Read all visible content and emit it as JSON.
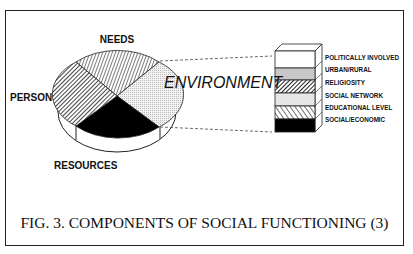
{
  "figure": {
    "caption": "FIG. 3. COMPONENTS OF SOCIAL FUNCTIONING (3)",
    "pie": {
      "segments": [
        {
          "label": "NEEDS",
          "pattern": "vertical-hatch"
        },
        {
          "label": "ENVIRONMENT",
          "pattern": "light-dots"
        },
        {
          "label": "RESOURCES",
          "pattern": "solid-black"
        },
        {
          "label": "PERSON",
          "pattern": "diagonal-hatch"
        }
      ]
    },
    "labels": {
      "needs": "NEEDS",
      "person": "PERSON",
      "resources": "RESOURCES",
      "environment": "ENVIRONMENT"
    },
    "environment_stack": {
      "items": [
        {
          "label": "POLITICALLY INVOLVED",
          "fill": "#ffffff"
        },
        {
          "label": "URBAN/RURAL",
          "fill": "#c8c8c8"
        },
        {
          "label": "RELIGIOSITY",
          "fill": "pattern-dense-hatch"
        },
        {
          "label": "SOCIAL NETWORK",
          "fill": "#e4e4e4"
        },
        {
          "label": "EDUCATIONAL LEVEL",
          "fill": "pattern-diagonal"
        },
        {
          "label": "SOCIAL/ECONOMIC",
          "fill": "#000000"
        }
      ]
    }
  }
}
